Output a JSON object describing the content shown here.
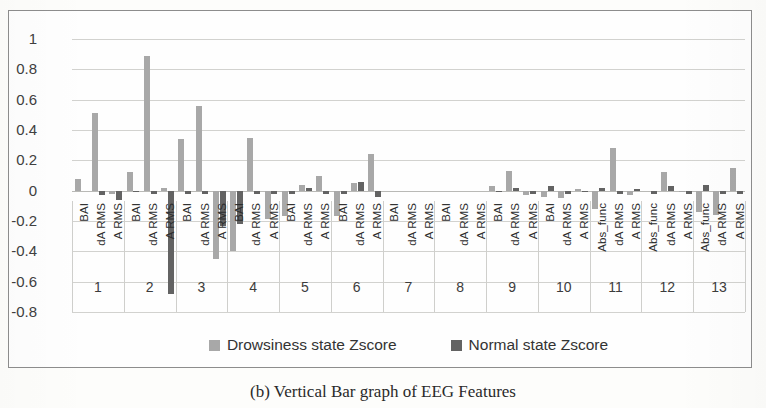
{
  "chart_data": {
    "type": "bar",
    "title": "",
    "xlabel": "",
    "ylabel": "",
    "ylim": [
      -0.8,
      1
    ],
    "grid": true,
    "legend_position": "bottom",
    "ytick_labels": [
      "1",
      "0.8",
      "0.6",
      "0.4",
      "0.2",
      "0",
      "-0.2",
      "-0.4",
      "-0.6",
      "-0.8"
    ],
    "ytick_values": [
      1,
      0.8,
      0.6,
      0.4,
      0.2,
      0,
      -0.2,
      -0.4,
      -0.6,
      -0.8
    ],
    "group_labels": [
      "1",
      "2",
      "3",
      "4",
      "5",
      "6",
      "7",
      "8",
      "9",
      "10",
      "11",
      "12",
      "13"
    ],
    "metric_labels": [
      "BAI",
      "dA RMS",
      "A RMS"
    ],
    "metric_labels_alt": [
      "Abs_func",
      "dA RMS",
      "A RMS"
    ],
    "categories": [
      "BAI",
      "dA RMS",
      "A RMS",
      "BAI",
      "dA RMS",
      "A RMS",
      "BAI",
      "dA RMS",
      "A RMS",
      "BAI",
      "dA RMS",
      "A RMS",
      "BAI",
      "dA RMS",
      "A RMS",
      "BAI",
      "dA RMS",
      "A RMS",
      "BAI",
      "dA RMS",
      "A RMS",
      "BAI",
      "dA RMS",
      "A RMS",
      "BAI",
      "dA RMS",
      "A RMS",
      "BAI",
      "dA RMS",
      "A RMS",
      "Abs_func",
      "dA RMS",
      "A RMS",
      "Abs_func",
      "dA RMS",
      "A RMS",
      "Abs_func",
      "dA RMS",
      "A RMS"
    ],
    "series": [
      {
        "name": "Drowsiness state Zscore",
        "color": "#a8a8a8",
        "values": [
          0.08,
          0.51,
          -0.02,
          0.12,
          0.89,
          0.02,
          0.34,
          0.56,
          -0.45,
          -0.4,
          0.35,
          -0.19,
          -0.17,
          0.04,
          0.1,
          -0.17,
          0.05,
          0.24,
          0.0,
          0.0,
          0.0,
          0.0,
          0.0,
          0.0,
          0.03,
          0.13,
          -0.03,
          -0.04,
          -0.05,
          0.01,
          -0.12,
          0.28,
          -0.03,
          0.0,
          0.12,
          -0.01,
          -0.14,
          -0.16,
          0.15
        ]
      },
      {
        "name": "Normal state Zscore",
        "color": "#636363",
        "values": [
          0.0,
          -0.03,
          -0.06,
          -0.01,
          -0.02,
          -0.68,
          -0.02,
          -0.02,
          -0.23,
          -0.22,
          -0.02,
          -0.02,
          -0.02,
          0.02,
          -0.02,
          -0.02,
          0.06,
          -0.04,
          0.0,
          0.0,
          0.0,
          0.0,
          0.0,
          0.0,
          -0.01,
          0.02,
          -0.02,
          0.03,
          -0.02,
          -0.01,
          0.02,
          -0.02,
          0.01,
          -0.02,
          0.03,
          -0.02,
          0.04,
          -0.02,
          -0.02
        ]
      }
    ]
  },
  "legend": {
    "items": [
      {
        "label": "Drowsiness state Zscore",
        "color": "#a8a8a8"
      },
      {
        "label": "Normal state Zscore",
        "color": "#636363"
      }
    ]
  },
  "caption": {
    "text": "(b)  Vertical Bar graph of EEG Features"
  }
}
